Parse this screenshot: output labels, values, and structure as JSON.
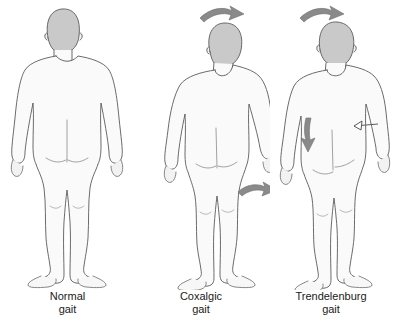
{
  "illustration": {
    "title_visible": false,
    "background_color": "#ffffff",
    "panel_count": 3,
    "view": "posterior",
    "style": {
      "outline_color": "#555555",
      "body_fill": "#fafafa",
      "shade_fill": "#ededed",
      "hair_fill": "#c9c9c9",
      "arrow_fill": "#8a8a8a",
      "text_color": "#1a1a1a"
    }
  },
  "panels": [
    {
      "id": "normal",
      "caption_line1": "Normal",
      "caption_line2": "gait",
      "figure_name": "normal-gait-figure",
      "posture": "upright symmetric stance, level shoulders, level pelvis",
      "annotations": []
    },
    {
      "id": "coxalgic",
      "caption_line1": "Coxalgic",
      "caption_line2": "gait",
      "figure_name": "coxalgic-gait-figure",
      "posture": "trunk leans toward affected side, shoulder drop, arm swings outward",
      "annotations": [
        {
          "name": "trunk-shift-arrow-top",
          "type": "arrow",
          "direction": "right",
          "location": "above head"
        },
        {
          "name": "arm-shift-arrow-lower",
          "type": "arrow",
          "direction": "right",
          "location": "beside right hand"
        }
      ]
    },
    {
      "id": "trendelenburg",
      "caption_line1": "Trendelenburg",
      "caption_line2": "gait",
      "figure_name": "trendelenburg-gait-figure",
      "posture": "trunk leans toward stance side, contralateral pelvis drops",
      "annotations": [
        {
          "name": "trunk-shift-arrow-top",
          "type": "arrow",
          "direction": "right",
          "location": "above head"
        },
        {
          "name": "pelvic-drop-arrow",
          "type": "arrow",
          "direction": "down",
          "location": "left buttock / pelvis"
        },
        {
          "name": "pelvic-level-marker",
          "type": "line-with-arrowhead",
          "direction": "left",
          "location": "right iliac crest"
        }
      ]
    }
  ]
}
